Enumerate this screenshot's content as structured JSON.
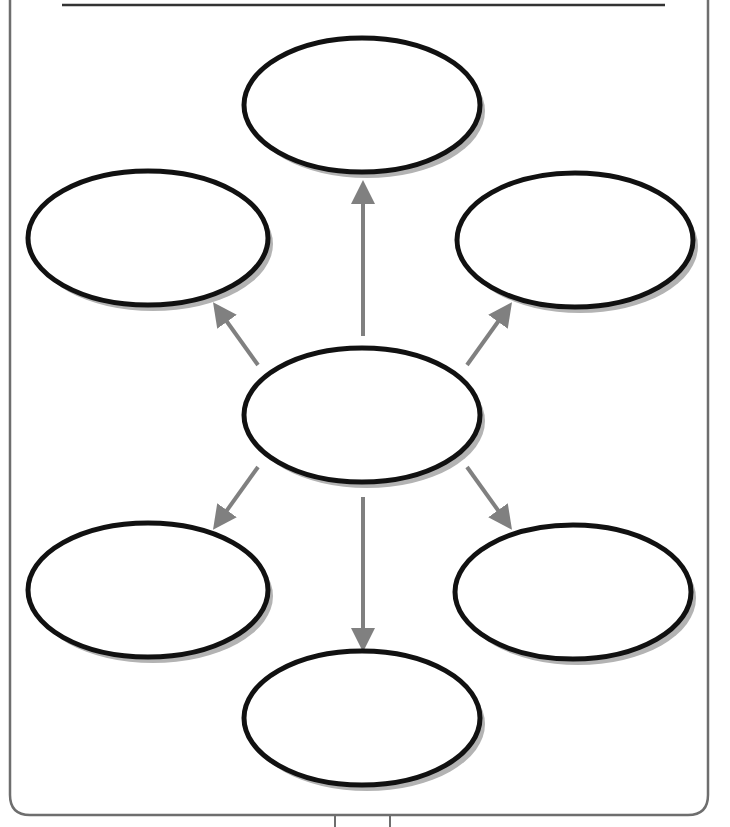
{
  "title_line": {
    "label": ""
  },
  "colors": {
    "frame": "#6e6e6e",
    "ellipse_stroke": "#111111",
    "ellipse_shadow": "#b3b3b3",
    "arrow": "#808080",
    "background": "#ffffff"
  },
  "nodes": [
    {
      "id": "top",
      "label": "",
      "cx": 362,
      "cy": 105,
      "rx": 118,
      "ry": 67
    },
    {
      "id": "upper-left",
      "label": "",
      "cx": 148,
      "cy": 238,
      "rx": 120,
      "ry": 67
    },
    {
      "id": "upper-right",
      "label": "",
      "cx": 575,
      "cy": 240,
      "rx": 118,
      "ry": 67
    },
    {
      "id": "center",
      "label": "",
      "cx": 362,
      "cy": 415,
      "rx": 118,
      "ry": 67
    },
    {
      "id": "lower-left",
      "label": "",
      "cx": 148,
      "cy": 590,
      "rx": 120,
      "ry": 67
    },
    {
      "id": "lower-right",
      "label": "",
      "cx": 573,
      "cy": 592,
      "rx": 118,
      "ry": 67
    },
    {
      "id": "bottom",
      "label": "",
      "cx": 362,
      "cy": 718,
      "rx": 118,
      "ry": 67
    }
  ],
  "edges": [
    {
      "from": "center",
      "to": "top",
      "x1": 363,
      "y1": 336,
      "x2": 363,
      "y2": 192
    },
    {
      "from": "center",
      "to": "upper-left",
      "x1": 258,
      "y1": 365,
      "x2": 220,
      "y2": 312
    },
    {
      "from": "center",
      "to": "upper-right",
      "x1": 467,
      "y1": 365,
      "x2": 505,
      "y2": 312
    },
    {
      "from": "center",
      "to": "lower-left",
      "x1": 258,
      "y1": 467,
      "x2": 220,
      "y2": 520
    },
    {
      "from": "center",
      "to": "lower-right",
      "x1": 467,
      "y1": 467,
      "x2": 505,
      "y2": 520
    },
    {
      "from": "center",
      "to": "bottom",
      "x1": 363,
      "y1": 497,
      "x2": 363,
      "y2": 640
    }
  ]
}
